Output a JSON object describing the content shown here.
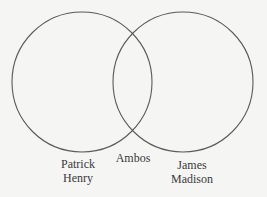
{
  "diagram": {
    "type": "venn",
    "stroke_color": "#5a5a5a",
    "background_color": "#f5f5f4",
    "text_color": "#3a3a3a",
    "sets": [
      {
        "id": "left",
        "label_lines": [
          "Patrick",
          "Henry"
        ],
        "circle": {
          "cx": 82,
          "cy": 82,
          "r": 70
        }
      },
      {
        "id": "right",
        "label_lines": [
          "James",
          "Madison"
        ],
        "circle": {
          "cx": 183,
          "cy": 82,
          "r": 70
        }
      }
    ],
    "intersection": {
      "label": "Ambos"
    }
  }
}
